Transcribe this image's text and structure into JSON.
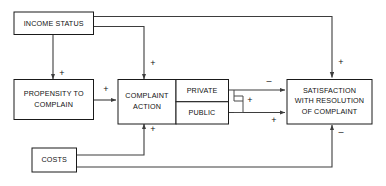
{
  "diagram": {
    "type": "flow-diagram",
    "background_color": "#ffffff",
    "line_color": "#3d3d3d",
    "text_color": "#111111",
    "nodes": [
      {
        "id": "income_status",
        "label": "INCOME STATUS",
        "lines": [
          "INCOME STATUS"
        ]
      },
      {
        "id": "propensity",
        "label": "PROPENSITY TO COMPLAIN",
        "lines": [
          "PROPENSITY TO",
          "COMPLAIN"
        ]
      },
      {
        "id": "complaint_action",
        "label": "COMPLAINT ACTION",
        "lines": [
          "COMPLAINT",
          "ACTION"
        ]
      },
      {
        "id": "private",
        "label": "PRIVATE",
        "lines": [
          "PRIVATE"
        ]
      },
      {
        "id": "public",
        "label": "PUBLIC",
        "lines": [
          "PUBLIC"
        ]
      },
      {
        "id": "satisfaction",
        "label": "SATISFACTION WITH RESOLUTION OF COMPLAINT",
        "lines": [
          "SATISFACTION",
          "WITH RESOLUTION",
          "OF COMPLAINT"
        ]
      },
      {
        "id": "costs",
        "label": "COSTS",
        "lines": [
          "COSTS"
        ]
      }
    ],
    "edges": [
      {
        "id": "income-to-propensity",
        "from": "income_status",
        "to": "propensity",
        "sign": "+"
      },
      {
        "id": "income-to-complaint-action",
        "from": "income_status",
        "to": "complaint_action",
        "sign": "+"
      },
      {
        "id": "income-to-satisfaction",
        "from": "income_status",
        "to": "satisfaction",
        "sign": "+"
      },
      {
        "id": "propensity-to-complaint-action",
        "from": "propensity",
        "to": "complaint_action",
        "sign": "+"
      },
      {
        "id": "private-to-satisfaction",
        "from": "private",
        "to": "satisfaction",
        "sign": "–"
      },
      {
        "id": "public-to-satisfaction",
        "from": "public",
        "to": "satisfaction",
        "sign": "+"
      },
      {
        "id": "private-public-link",
        "from": "private",
        "to": "public",
        "sign": "+"
      },
      {
        "id": "costs-to-complaint-action",
        "from": "costs",
        "to": "complaint_action",
        "sign": "+"
      },
      {
        "id": "costs-to-satisfaction",
        "from": "costs",
        "to": "satisfaction",
        "sign": "–"
      }
    ]
  }
}
